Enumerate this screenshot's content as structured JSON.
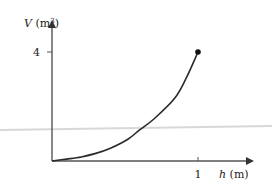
{
  "chart_data": {
    "type": "line",
    "title": "",
    "xlabel_var": "h",
    "xlabel_unit": " (m)",
    "ylabel_var": "V",
    "ylabel_unit": " (m",
    "ylabel_sup": "3",
    "ylabel_close": ")",
    "xlim": [
      0,
      1.35
    ],
    "ylim": [
      0,
      5.1
    ],
    "x_ticks": [
      {
        "value": 1,
        "label": "1"
      }
    ],
    "y_ticks": [
      {
        "value": 4,
        "label": "4"
      }
    ],
    "grid": false,
    "series": [
      {
        "name": "V(h)",
        "x": [
          0,
          0.1,
          0.2,
          0.3,
          0.4,
          0.52,
          0.6,
          0.7,
          0.84,
          0.92,
          1.0
        ],
        "y": [
          0,
          0.07,
          0.15,
          0.28,
          0.47,
          0.8,
          1.14,
          1.55,
          2.3,
          3.05,
          4.0
        ],
        "endpoint_marker": {
          "x": 1,
          "y": 4
        }
      }
    ],
    "colors": {
      "axis": "#555555",
      "curve": "#2a2a2a",
      "marker": "#111111",
      "stray_line": "#d8d8d8"
    }
  }
}
